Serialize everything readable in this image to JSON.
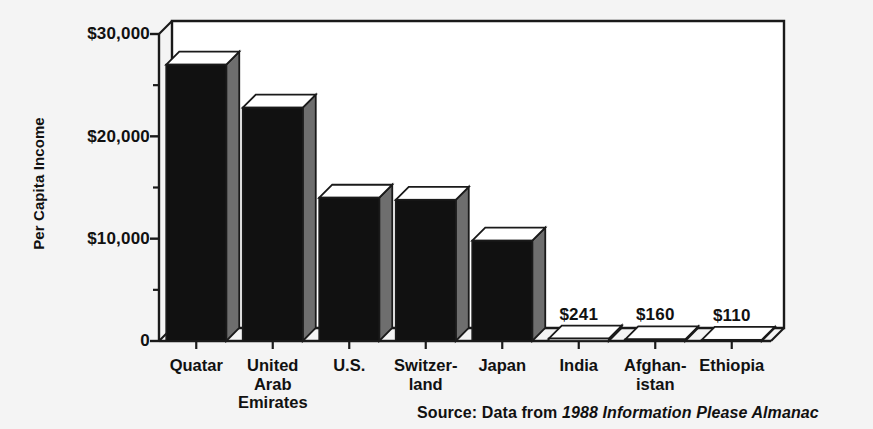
{
  "chart_data": {
    "type": "bar",
    "title": "",
    "xlabel": "",
    "ylabel": "Per Capita Income",
    "ylim": [
      0,
      30000
    ],
    "grid": false,
    "legend": "none",
    "style": "3d-bar",
    "categories": [
      "Quatar",
      "United\nArab\nEmirates",
      "U.S.",
      "Switzer-\nland",
      "Japan",
      "India",
      "Afghan-\nistan",
      "Ethiopia"
    ],
    "values": [
      27000,
      22800,
      14000,
      13800,
      9800,
      241,
      160,
      110
    ],
    "value_labels": [
      "",
      "",
      "",
      "",
      "",
      "$241",
      "$160",
      "$110"
    ],
    "ytick_labels": [
      "$30,000",
      "$20,000",
      "$10,000",
      "0"
    ],
    "ytick_values": [
      30000,
      20000,
      10000,
      0
    ],
    "yminor_values": [
      25000,
      15000,
      5000
    ],
    "source_prefix": "Source:  Data from ",
    "source_title": "1988 Information Please Almanac"
  },
  "colors": {
    "background": "#f4f4f4",
    "bar_front": "#111111",
    "bar_side": "#6e6e6e",
    "bar_top": "#ffffff",
    "axis": "#1a1a1a",
    "text": "#111111"
  }
}
